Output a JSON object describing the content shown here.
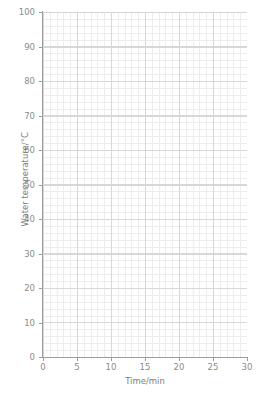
{
  "chart_data": {
    "type": "line",
    "title": "",
    "subtitle": "",
    "xlabel": "Time/min",
    "ylabel": "Water temperature/°C",
    "xlim": [
      0,
      30
    ],
    "ylim": [
      0,
      100
    ],
    "x_ticks": [
      0,
      5,
      10,
      15,
      20,
      25,
      30
    ],
    "x_tick_labels": [
      "0",
      "5",
      "10",
      "15",
      "20",
      "25",
      "30"
    ],
    "y_ticks": [
      0,
      10,
      20,
      30,
      40,
      50,
      60,
      70,
      80,
      90,
      100
    ],
    "y_tick_labels": [
      "0",
      "10",
      "20",
      "30",
      "40",
      "50",
      "60",
      "70",
      "80",
      "90",
      "100"
    ],
    "x_minor_step": 1,
    "y_minor_step": 1,
    "grid": true,
    "grid_major": true,
    "grid_minor": true,
    "legend": false,
    "legend_position": "none",
    "annotations": [],
    "series": [],
    "values": [],
    "categories": [],
    "note": "Blank graph paper grid — no data series plotted"
  },
  "axes": {
    "y_axis_title": "Water temperature/°C",
    "x_axis_title": "Time/min",
    "y_tick_labels": [
      "100",
      "90",
      "80",
      "70",
      "60",
      "50",
      "40",
      "30",
      "20",
      "10",
      "0"
    ],
    "x_tick_labels": [
      "0",
      "5",
      "10",
      "15",
      "20",
      "25",
      "30"
    ]
  },
  "colors": {
    "background": "#ffffff",
    "grid_major": "#d7d7d7",
    "grid_minor": "#ededed",
    "spine": "#9c9c9c",
    "tick_label": "#8b8b8b",
    "axis_title": "#7d7d7d"
  }
}
